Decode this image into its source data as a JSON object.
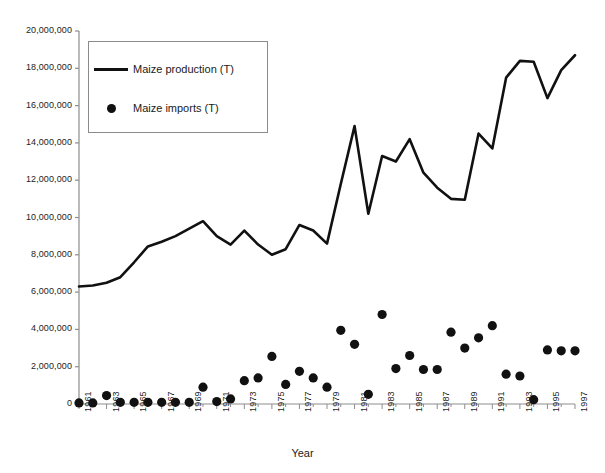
{
  "chart_data": {
    "type": "line",
    "title": "",
    "xlabel": "Year",
    "ylabel": "",
    "xlim": [
      1961,
      1997
    ],
    "ylim": [
      0,
      20000000
    ],
    "grid": false,
    "legend_position": "top-left",
    "x": [
      1961,
      1962,
      1963,
      1964,
      1965,
      1966,
      1967,
      1968,
      1969,
      1970,
      1971,
      1972,
      1973,
      1974,
      1975,
      1976,
      1977,
      1978,
      1979,
      1980,
      1981,
      1982,
      1983,
      1984,
      1985,
      1986,
      1987,
      1988,
      1989,
      1990,
      1991,
      1992,
      1993,
      1994,
      1995,
      1996,
      1997
    ],
    "x_tick_labels": [
      "1961",
      "1963",
      "1965",
      "1967",
      "1969",
      "1971",
      "1973",
      "1975",
      "1977",
      "1979",
      "1981",
      "1983",
      "1985",
      "1987",
      "1989",
      "1991",
      "1993",
      "1995",
      "1997"
    ],
    "y_tick_labels": [
      "0",
      "2,000,000",
      "4,000,000",
      "6,000,000",
      "8,000,000",
      "10,000,000",
      "12,000,000",
      "14,000,000",
      "16,000,000",
      "18,000,000",
      "20,000,000"
    ],
    "y_tick_values": [
      0,
      2000000,
      4000000,
      6000000,
      8000000,
      10000000,
      12000000,
      14000000,
      16000000,
      18000000,
      20000000
    ],
    "series": [
      {
        "name": "Maize production (T)",
        "marker": "line",
        "color": "#111111",
        "values": [
          6300000,
          6350000,
          6500000,
          6800000,
          7600000,
          8450000,
          8700000,
          9000000,
          9400000,
          9800000,
          9000000,
          8550000,
          9300000,
          8550000,
          8000000,
          8300000,
          9600000,
          9300000,
          8600000,
          11800000,
          14900000,
          10200000,
          13300000,
          13000000,
          14200000,
          12400000,
          11600000,
          11000000,
          10950000,
          14500000,
          13700000,
          17500000,
          18400000,
          18350000,
          16400000,
          17900000,
          18700000
        ]
      },
      {
        "name": "Maize imports (T)",
        "marker": "dot",
        "color": "#111111",
        "values": [
          60000,
          60000,
          450000,
          90000,
          90000,
          90000,
          90000,
          90000,
          90000,
          900000,
          130000,
          270000,
          1250000,
          1400000,
          2550000,
          1050000,
          1750000,
          1400000,
          900000,
          3950000,
          3200000,
          520000,
          4800000,
          1900000,
          2600000,
          1850000,
          1850000,
          3850000,
          3000000,
          3550000,
          4200000,
          1600000,
          1500000,
          230000,
          2900000,
          2850000,
          2850000
        ]
      }
    ]
  },
  "legend": {
    "items": [
      {
        "label": "Maize production (T)",
        "marker": "line"
      },
      {
        "label": "Maize imports (T)",
        "marker": "dot"
      }
    ]
  },
  "axis": {
    "x_title": "Year"
  }
}
